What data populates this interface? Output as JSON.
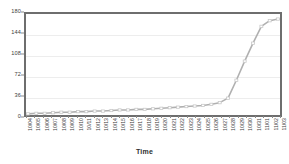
{
  "chart_data": {
    "type": "line",
    "title": "",
    "subtitle": "",
    "xlabel": "Time",
    "ylabel": "",
    "ylim": [
      0,
      180
    ],
    "yticks": [
      180,
      144,
      108,
      72,
      36,
      0
    ],
    "grid": true,
    "legend": "none",
    "line_color": "#b0b0b0",
    "marker_color": "#c8c8c8",
    "axis_color": "#6e6e6e",
    "gridline_color": "#ededed",
    "categories": [
      "10/04",
      "10/05",
      "10/06",
      "10/07",
      "10/08",
      "10/09",
      "10/10",
      "10/11",
      "10/12",
      "10/13",
      "10/14",
      "10/15",
      "10/16",
      "10/17",
      "10/18",
      "10/19",
      "10/20",
      "10/21",
      "10/22",
      "10/23",
      "10/24",
      "10/25",
      "10/26",
      "10/27",
      "10/28",
      "10/29",
      "10/30",
      "10/31",
      "11/01",
      "11/02",
      "11/03"
    ],
    "values": [
      2,
      3,
      3,
      4,
      5,
      5,
      6,
      6,
      7,
      7,
      8,
      9,
      9,
      10,
      10,
      11,
      12,
      13,
      14,
      15,
      16,
      17,
      19,
      22,
      30,
      62,
      96,
      128,
      158,
      168,
      171
    ],
    "series": [
      {
        "name": "Cumulative count",
        "values": [
          2,
          3,
          3,
          4,
          5,
          5,
          6,
          6,
          7,
          7,
          8,
          9,
          9,
          10,
          10,
          11,
          12,
          13,
          14,
          15,
          16,
          17,
          19,
          22,
          30,
          62,
          96,
          128,
          158,
          168,
          171
        ]
      }
    ]
  }
}
